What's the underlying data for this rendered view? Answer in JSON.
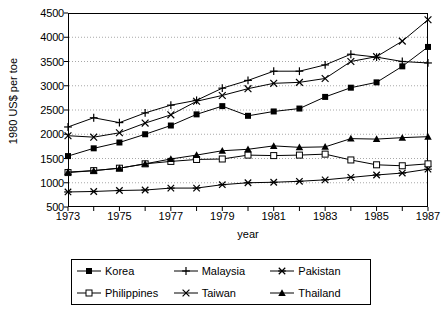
{
  "chart_data": {
    "type": "line",
    "title": "",
    "xlabel": "year",
    "ylabel": "1980 US$ per toe",
    "xlim": [
      1973,
      1987
    ],
    "ylim": [
      500,
      4500
    ],
    "ytick_step": 500,
    "xtick_step": 1,
    "xtick_label_step": 2,
    "grid": true,
    "legend_position": "below",
    "x": [
      1973,
      1974,
      1975,
      1976,
      1977,
      1978,
      1979,
      1980,
      1981,
      1982,
      1983,
      1984,
      1985,
      1986,
      1987
    ],
    "xticklabels": [
      "1973",
      "1975",
      "1977",
      "1979",
      "1981",
      "1983",
      "1985",
      "1987"
    ],
    "yticklabels": [
      "500",
      "1000",
      "1500",
      "2000",
      "2500",
      "3000",
      "3500",
      "4000",
      "4500"
    ],
    "series": [
      {
        "name": "Korea",
        "marker": "filled-square",
        "values": [
          1550,
          1710,
          1830,
          2000,
          2180,
          2410,
          2580,
          2380,
          2470,
          2530,
          2770,
          2960,
          3070,
          3400,
          3800
        ]
      },
      {
        "name": "Malaysia",
        "marker": "plus",
        "values": [
          2150,
          2340,
          2240,
          2440,
          2600,
          2700,
          2950,
          3110,
          3300,
          3300,
          3430,
          3650,
          3590,
          3500,
          3470
        ]
      },
      {
        "name": "Pakistan",
        "marker": "asterisk",
        "values": [
          810,
          820,
          840,
          850,
          890,
          890,
          960,
          1000,
          1010,
          1030,
          1060,
          1110,
          1160,
          1200,
          1280
        ]
      },
      {
        "name": "Philippines",
        "marker": "open-square",
        "values": [
          1210,
          1250,
          1300,
          1390,
          1440,
          1480,
          1490,
          1570,
          1560,
          1570,
          1590,
          1470,
          1370,
          1350,
          1390
        ]
      },
      {
        "name": "Taiwan",
        "marker": "cross",
        "values": [
          1970,
          1940,
          2030,
          2230,
          2400,
          2680,
          2800,
          2940,
          3050,
          3070,
          3150,
          3500,
          3600,
          3920,
          4360
        ]
      },
      {
        "name": "Thailand",
        "marker": "filled-triangle",
        "values": [
          1220,
          1250,
          1300,
          1390,
          1490,
          1570,
          1660,
          1690,
          1760,
          1730,
          1740,
          1910,
          1900,
          1930,
          1950
        ]
      }
    ]
  },
  "axes": {
    "ylabel": "1980 US$ per toe",
    "xlabel": "year"
  },
  "legend": {
    "items": [
      {
        "label": "Korea",
        "marker": "filled-square"
      },
      {
        "label": "Malaysia",
        "marker": "plus"
      },
      {
        "label": "Pakistan",
        "marker": "asterisk"
      },
      {
        "label": "Philippines",
        "marker": "open-square"
      },
      {
        "label": "Taiwan",
        "marker": "cross"
      },
      {
        "label": "Thailand",
        "marker": "filled-triangle"
      }
    ]
  },
  "colors": {
    "line": "#000000",
    "grid": "#a8a8a8",
    "frame": "#000000",
    "background": "#ffffff"
  }
}
